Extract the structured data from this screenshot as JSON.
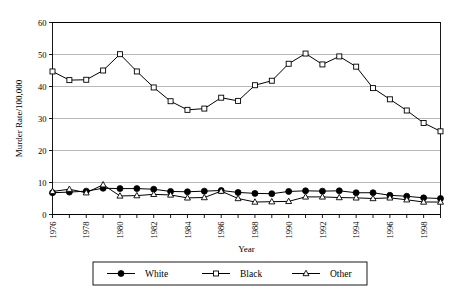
{
  "chart_data": {
    "type": "line",
    "title": "",
    "xlabel": "Year",
    "ylabel": "Murder Rate/100,000",
    "xlim": [
      1976,
      1999
    ],
    "ylim": [
      0,
      60
    ],
    "yticks": [
      0,
      10,
      20,
      30,
      40,
      50,
      60
    ],
    "ytick_labels": [
      "0",
      "10",
      "20",
      "30",
      "40",
      "50",
      "60"
    ],
    "xticks": [
      1976,
      1977,
      1978,
      1979,
      1980,
      1981,
      1982,
      1983,
      1984,
      1985,
      1986,
      1987,
      1988,
      1989,
      1990,
      1991,
      1992,
      1993,
      1994,
      1995,
      1996,
      1997,
      1998,
      1999
    ],
    "xtick_labels": [
      "1976",
      "",
      "1978",
      "",
      "1980",
      "",
      "1982",
      "",
      "1984",
      "",
      "1986",
      "",
      "1988",
      "",
      "1990",
      "",
      "1992",
      "",
      "1994",
      "",
      "1996",
      "",
      "1998",
      ""
    ],
    "x": [
      1976,
      1977,
      1978,
      1979,
      1980,
      1981,
      1982,
      1983,
      1984,
      1985,
      1986,
      1987,
      1988,
      1989,
      1990,
      1991,
      1992,
      1993,
      1994,
      1995,
      1996,
      1997,
      1998,
      1999
    ],
    "grid": true,
    "grid_axis": "y",
    "legend_position": "bottom",
    "series": [
      {
        "name": "White",
        "marker": "filled-circle",
        "color": "#000000",
        "values": [
          6.8,
          7.0,
          7.3,
          8.2,
          8.1,
          8.1,
          7.9,
          7.2,
          7.1,
          7.3,
          7.5,
          6.9,
          6.6,
          6.5,
          7.2,
          7.4,
          7.3,
          7.4,
          6.8,
          6.8,
          6.0,
          5.7,
          5.2,
          5.0
        ]
      },
      {
        "name": "Black",
        "marker": "open-square",
        "color": "#000000",
        "values": [
          44.7,
          42.0,
          42.1,
          45.0,
          50.1,
          44.7,
          39.7,
          35.4,
          32.7,
          33.1,
          36.5,
          35.5,
          40.4,
          41.8,
          47.1,
          50.3,
          46.9,
          49.4,
          46.2,
          39.5,
          36.0,
          32.5,
          28.6,
          26.0
        ]
      },
      {
        "name": "Other",
        "marker": "open-triangle",
        "color": "#000000",
        "values": [
          7.2,
          7.9,
          6.8,
          9.3,
          5.8,
          5.9,
          6.3,
          6.1,
          5.2,
          5.3,
          7.3,
          5.0,
          3.9,
          4.0,
          4.1,
          5.5,
          5.5,
          5.3,
          5.2,
          5.0,
          5.2,
          4.6,
          3.9,
          3.9
        ]
      }
    ]
  },
  "legend": {
    "items": [
      {
        "label": "White"
      },
      {
        "label": "Black"
      },
      {
        "label": "Other"
      }
    ]
  }
}
